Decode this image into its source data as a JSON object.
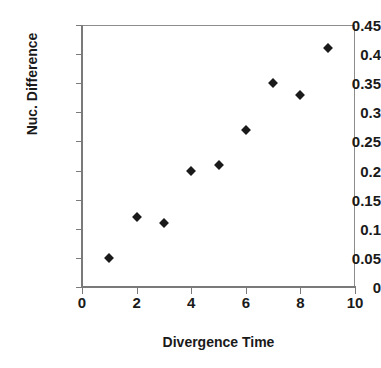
{
  "chart_data": {
    "type": "scatter",
    "title": "",
    "xlabel": "Divergence Time",
    "ylabel": "Nuc. Difference",
    "x": [
      1,
      2,
      3,
      4,
      5,
      6,
      7,
      8,
      9
    ],
    "values": [
      0.05,
      0.12,
      0.11,
      0.2,
      0.21,
      0.27,
      0.35,
      0.33,
      0.41
    ],
    "points": [
      {
        "x": 1,
        "y": 0.05
      },
      {
        "x": 2,
        "y": 0.12
      },
      {
        "x": 3,
        "y": 0.11
      },
      {
        "x": 4,
        "y": 0.2
      },
      {
        "x": 5,
        "y": 0.21
      },
      {
        "x": 6,
        "y": 0.27
      },
      {
        "x": 7,
        "y": 0.35
      },
      {
        "x": 8,
        "y": 0.33
      },
      {
        "x": 9,
        "y": 0.41
      }
    ],
    "xlim": [
      0,
      10
    ],
    "ylim": [
      0,
      0.45
    ],
    "xticks": [
      0,
      2,
      4,
      6,
      8,
      10
    ],
    "xtick_labels": [
      "0",
      "2",
      "4",
      "6",
      "8",
      "10"
    ],
    "yticks": [
      0,
      0.05,
      0.1,
      0.15,
      0.2,
      0.25,
      0.3,
      0.35,
      0.4,
      0.45
    ],
    "ytick_labels": [
      "0",
      "0.05",
      "0.1",
      "0.15",
      "0.2",
      "0.25",
      "0.3",
      "0.35",
      "0.4",
      "0.45"
    ],
    "grid": false,
    "legend": null,
    "marker_shape": "diamond",
    "marker_color": "#1a1a1a",
    "axis_color": "#7a7a7a",
    "background": "#ffffff"
  }
}
